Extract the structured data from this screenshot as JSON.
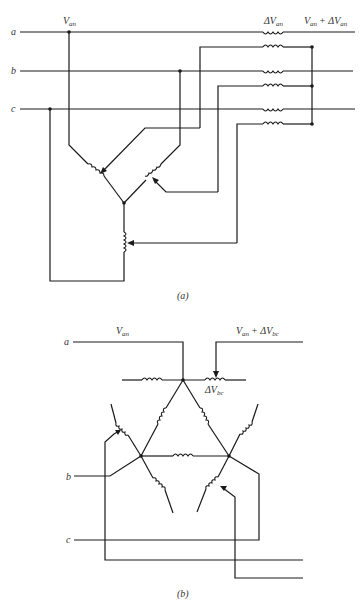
{
  "figure_a": {
    "caption": "(a)",
    "line_labels": [
      "a",
      "b",
      "c"
    ],
    "label_van": "V",
    "label_van_sub": "an",
    "label_delta_van": "ΔV",
    "label_delta_van_sub": "an",
    "label_sum_left": "V",
    "label_sum_left_sub": "an",
    "label_sum_plus": "+ ΔV",
    "label_sum_right_sub": "an"
  },
  "figure_b": {
    "caption": "(b)",
    "line_labels": [
      "a",
      "b",
      "c"
    ],
    "label_van": "V",
    "label_van_sub": "an",
    "label_sum_left": "V",
    "label_sum_left_sub": "an",
    "label_sum_plus": "+ ΔV",
    "label_sum_right_sub": "bc",
    "label_delta_vbc": "ΔV",
    "label_delta_vbc_sub": "bc"
  }
}
